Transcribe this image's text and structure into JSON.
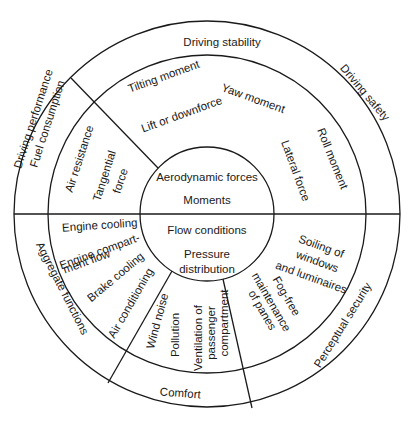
{
  "diagram": {
    "center": {
      "top": [
        "Aerodynamic forces",
        "Moments"
      ],
      "bottom": [
        "Flow conditions",
        "Pressure",
        "distribution"
      ]
    },
    "outer_ring": {
      "top": "Driving stability",
      "top_right": "Driving safety",
      "left_upper": [
        "Driving performance",
        "Fuel consumption"
      ],
      "left_lower": "Aggregate functions",
      "bottom": "Comfort",
      "bottom_right": "Perceptual security"
    },
    "middle_ring": {
      "upper": {
        "tilting": "Tilting moment",
        "lift": "Lift or downforce",
        "yaw": "Yaw moment",
        "roll": "Roll moment",
        "lateral": "Lateral force",
        "air_resistance": "Air resistance",
        "tangential": [
          "Tangential",
          "force"
        ]
      },
      "lower_left": {
        "engine_cooling": "Engine cooling",
        "engine_compartment": [
          "Engine compart-",
          "ment flow"
        ],
        "brake_cooling": "Brake cooling",
        "air_conditioning": "Air conditioning"
      },
      "lower_middle": {
        "wind_noise": "Wind noise",
        "pollution": "Pollution",
        "ventilation": [
          "Ventilation of",
          "passenger",
          "compartment"
        ]
      },
      "lower_right": {
        "soiling": [
          "Soiling of",
          "windows",
          "and luminaires"
        ],
        "fog_free": [
          "Fog-free",
          "maintenance",
          "of panes"
        ]
      }
    },
    "colors": {
      "line": "#1a1a1a",
      "background": "#ffffff"
    }
  }
}
